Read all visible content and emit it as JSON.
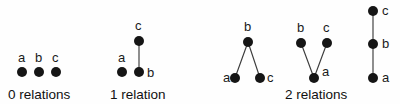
{
  "figure": {
    "width": 400,
    "height": 104,
    "background_color": "#fefefe",
    "node_color": "#151515",
    "edge_color": "#3c3c3c",
    "text_color": "#111111",
    "node_radius": 5
  },
  "groups": [
    {
      "id": "group-0-relations",
      "caption": "0 relations",
      "caption_x": 8,
      "caption_y": 99,
      "graphs": [
        {
          "id": "graph-0r-1",
          "nodes": [
            {
              "label": "a",
              "x": 22,
              "y": 72,
              "label_x": 18,
              "label_y": 62
            },
            {
              "label": "b",
              "x": 39,
              "y": 72,
              "label_x": 35,
              "label_y": 62
            },
            {
              "label": "c",
              "x": 56,
              "y": 72,
              "label_x": 52,
              "label_y": 62
            }
          ],
          "edges": []
        }
      ]
    },
    {
      "id": "group-1-relation",
      "caption": "1 relation",
      "caption_x": 110,
      "caption_y": 99,
      "graphs": [
        {
          "id": "graph-1r-1",
          "nodes": [
            {
              "label": "c",
              "x": 139,
              "y": 41,
              "label_x": 135,
              "label_y": 30
            },
            {
              "label": "a",
              "x": 122,
              "y": 72,
              "label_x": 118,
              "label_y": 62
            },
            {
              "label": "b",
              "x": 139,
              "y": 72,
              "label_x": 147,
              "label_y": 77
            }
          ],
          "edges": [
            {
              "from": "c",
              "to": "b",
              "x1": 139,
              "y1": 41,
              "x2": 139,
              "y2": 72
            }
          ]
        }
      ]
    },
    {
      "id": "group-2-relations",
      "caption": "2 relations",
      "caption_x": 285,
      "caption_y": 99,
      "graphs": [
        {
          "id": "graph-2r-1",
          "nodes": [
            {
              "label": "b",
              "x": 248,
              "y": 42,
              "label_x": 244,
              "label_y": 31
            },
            {
              "label": "a",
              "x": 235,
              "y": 78,
              "label_x": 223,
              "label_y": 82
            },
            {
              "label": "c",
              "x": 260,
              "y": 78,
              "label_x": 267,
              "label_y": 82
            }
          ],
          "edges": [
            {
              "from": "b",
              "to": "a",
              "x1": 248,
              "y1": 42,
              "x2": 235,
              "y2": 78
            },
            {
              "from": "b",
              "to": "c",
              "x1": 248,
              "y1": 42,
              "x2": 260,
              "y2": 78
            }
          ]
        },
        {
          "id": "graph-2r-2",
          "nodes": [
            {
              "label": "b",
              "x": 301,
              "y": 43,
              "label_x": 297,
              "label_y": 32
            },
            {
              "label": "c",
              "x": 327,
              "y": 43,
              "label_x": 323,
              "label_y": 32
            },
            {
              "label": "a",
              "x": 314,
              "y": 78,
              "label_x": 322,
              "label_y": 76
            }
          ],
          "edges": [
            {
              "from": "b",
              "to": "a",
              "x1": 301,
              "y1": 43,
              "x2": 314,
              "y2": 78
            },
            {
              "from": "c",
              "to": "a",
              "x1": 327,
              "y1": 43,
              "x2": 314,
              "y2": 78
            }
          ]
        },
        {
          "id": "graph-2r-3",
          "nodes": [
            {
              "label": "c",
              "x": 373,
              "y": 11,
              "label_x": 382,
              "label_y": 15
            },
            {
              "label": "b",
              "x": 373,
              "y": 44,
              "label_x": 382,
              "label_y": 48
            },
            {
              "label": "a",
              "x": 373,
              "y": 78,
              "label_x": 382,
              "label_y": 82
            }
          ],
          "edges": [
            {
              "from": "c",
              "to": "b",
              "x1": 373,
              "y1": 11,
              "x2": 373,
              "y2": 44
            },
            {
              "from": "b",
              "to": "a",
              "x1": 373,
              "y1": 44,
              "x2": 373,
              "y2": 78
            }
          ]
        }
      ]
    }
  ]
}
